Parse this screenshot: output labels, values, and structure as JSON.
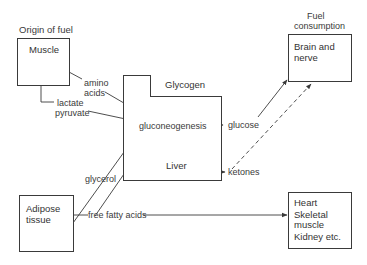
{
  "diagram": {
    "headings": {
      "origin": "Origin of fuel",
      "consumption_line1": "Fuel",
      "consumption_line2": "consumption"
    },
    "nodes": {
      "muscle": {
        "label": "Muscle"
      },
      "liver": {
        "label": "Liver",
        "glycogen": "Glycogen",
        "process": "gluconeogenesis"
      },
      "adipose": {
        "line1": "Adipose",
        "line2": "tissue"
      },
      "brain": {
        "line1": "Brain and",
        "line2": "nerve"
      },
      "heart": {
        "line1": "Heart",
        "line2": "Skeletal",
        "line3": "muscle",
        "line4": "Kidney etc."
      }
    },
    "edges": {
      "amino_line1": "amino",
      "amino_line2": "acids",
      "lactate": "lactate",
      "pyruvate": "pyruvate",
      "glycerol": "glycerol",
      "ffa": "free fatty acids",
      "glucose": "glucose",
      "ketones": "ketones"
    },
    "colors": {
      "line": "#3a3a3a",
      "background": "#ffffff"
    }
  }
}
